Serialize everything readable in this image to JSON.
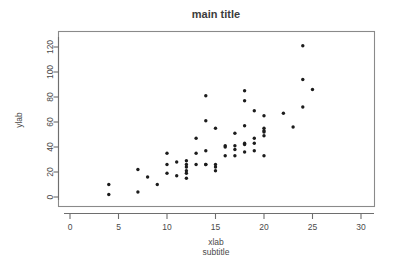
{
  "chart_data": {
    "type": "scatter",
    "title": "main title",
    "subtitle": "subtitle",
    "xlabel": "xlab",
    "ylabel": "ylab",
    "grid": false,
    "legend": null,
    "xlim": [
      0,
      31
    ],
    "ylim": [
      -3,
      130
    ],
    "xticks": [
      0,
      5,
      10,
      15,
      20,
      25,
      30
    ],
    "yticks": [
      0,
      20,
      40,
      60,
      80,
      100,
      120
    ],
    "xtick_labels": [
      "0",
      "5",
      "10",
      "15",
      "20",
      "25",
      "30"
    ],
    "ytick_labels": [
      "0",
      "20",
      "40",
      "60",
      "80",
      "100",
      "120"
    ],
    "point_color": "#1c1c1c",
    "point_symbol": "filled-circle",
    "n_points": 64,
    "x": [
      4,
      4,
      7,
      7,
      8,
      9,
      10,
      10,
      10,
      11,
      11,
      12,
      12,
      12,
      12,
      12,
      12,
      13,
      13,
      13,
      14,
      14,
      14,
      14,
      14,
      15,
      15,
      15,
      15,
      16,
      16,
      16,
      17,
      17,
      17,
      17,
      18,
      18,
      18,
      18,
      18,
      18,
      19,
      19,
      19,
      19,
      20,
      20,
      20,
      20,
      20,
      20,
      22,
      23,
      24,
      24,
      24,
      25
    ],
    "y": [
      10,
      2,
      22,
      4,
      16,
      10,
      35,
      26,
      19,
      28,
      17,
      29,
      26,
      24,
      21,
      19,
      15,
      47,
      35,
      26,
      81,
      61,
      37,
      26,
      26,
      55,
      26,
      24,
      21,
      41,
      40,
      33,
      51,
      41,
      38,
      33,
      85,
      77,
      57,
      43,
      42,
      36,
      69,
      47,
      43,
      37,
      65,
      55,
      53,
      52,
      49,
      33,
      67,
      56,
      121,
      94,
      72,
      86
    ]
  },
  "axes": {
    "x_axis_name": "x-axis",
    "y_axis_name": "y-axis"
  }
}
